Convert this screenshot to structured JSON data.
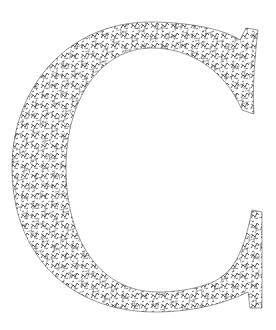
{
  "illustration": {
    "letter": "C",
    "description": "Decorative serif capital letter C filled with a dense black doodle/vine pattern on white",
    "colors": {
      "background": "#ffffff",
      "outline": "#9a9a9a",
      "fill_pattern": "#2a2a2a"
    }
  }
}
